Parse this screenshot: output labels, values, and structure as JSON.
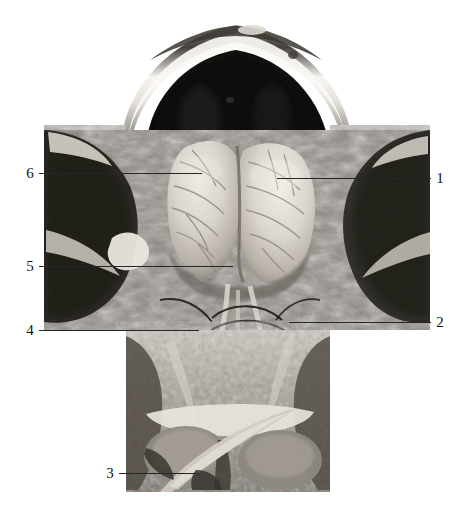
{
  "figure": {
    "kind": "anatomical-dissection-photograph",
    "view": "superior view of opened cranial cavity with anterior neck dissection",
    "color_mode": "grayscale",
    "background_color": "#ffffff",
    "line_color": "#262626",
    "number_color": "#141414"
  },
  "labels": [
    {
      "id": "label-1",
      "number": "1",
      "side": "right",
      "number_x": 441,
      "line_from_x": 278,
      "line_to_x": 432,
      "y": 178
    },
    {
      "id": "label-2",
      "number": "2",
      "side": "right",
      "number_x": 441,
      "line_from_x": 290,
      "line_to_x": 432,
      "y": 322
    },
    {
      "id": "label-3",
      "number": "3",
      "side": "left",
      "number_x": 110,
      "line_from_x": 122,
      "line_to_x": 196,
      "y": 473
    },
    {
      "id": "label-4",
      "number": "4",
      "side": "left",
      "number_x": 30,
      "line_from_x": 42,
      "line_to_x": 196,
      "y": 330
    },
    {
      "id": "label-5",
      "number": "5",
      "side": "left",
      "number_x": 30,
      "line_from_x": 42,
      "line_to_x": 230,
      "y": 266
    },
    {
      "id": "label-6",
      "number": "6",
      "side": "left",
      "number_x": 30,
      "line_from_x": 42,
      "line_to_x": 199,
      "y": 173
    }
  ],
  "photo_bounds": {
    "left": 44,
    "top": 12,
    "right": 430,
    "bottom": 492
  }
}
